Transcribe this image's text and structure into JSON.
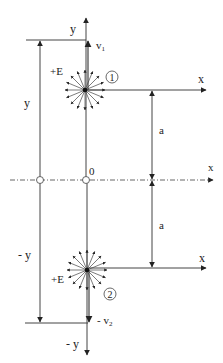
{
  "diagram": {
    "colors": {
      "line": "#333333",
      "background": "#ffffff"
    },
    "labels": {
      "y_top": "y",
      "v1": "v",
      "v1_sub": "1",
      "plus_e_top": "+E",
      "charge1": "1",
      "x_top": "x",
      "y_left": "y",
      "a_top": "a",
      "origin": "0",
      "x_mid": "x",
      "a_bottom": "a",
      "neg_y_left": "- y",
      "x_bottom": "x",
      "plus_e_bottom": "+E",
      "charge2": "2",
      "neg_v2": "- v",
      "v2_sub": "2",
      "neg_y_bottom": "- y"
    }
  }
}
